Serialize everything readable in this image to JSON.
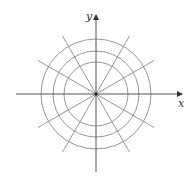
{
  "figure": {
    "width": 190,
    "height": 182,
    "center": {
      "x": 96,
      "y": 94
    },
    "axes": {
      "x_label": "x",
      "y_label": "y",
      "x_from": 16,
      "x_to": 182,
      "y_from": 172,
      "y_to": 15,
      "color": "#555555"
    },
    "circles": {
      "radii": [
        32,
        43,
        55
      ],
      "color": "#8a8a8a"
    },
    "rays": {
      "angles_deg": [
        30,
        60,
        120,
        150,
        210,
        240,
        300,
        330
      ],
      "length": 67,
      "color": "#8a8a8a"
    },
    "labels": {
      "x": {
        "text": "x",
        "x": 178,
        "y": 107
      },
      "y": {
        "text": "y",
        "x": 86,
        "y": 20
      }
    }
  }
}
